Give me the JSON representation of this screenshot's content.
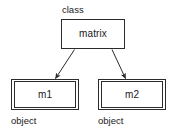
{
  "diagram": {
    "type": "uml-class-object-instantiation",
    "nodes": [
      {
        "id": "class-node",
        "name": "matrix",
        "stereotype": "class",
        "shape": "rectangle",
        "border_style": "single"
      },
      {
        "id": "object-node-m1",
        "name": "m1",
        "stereotype": "object",
        "shape": "rectangle",
        "border_style": "double"
      },
      {
        "id": "object-node-m2",
        "name": "m2",
        "stereotype": "object",
        "shape": "rectangle",
        "border_style": "double"
      }
    ],
    "edges": [
      {
        "id": "edge-matrix-m1",
        "from": "matrix",
        "to": "m1",
        "arrow": "open-arrowhead"
      },
      {
        "id": "edge-matrix-m2",
        "from": "matrix",
        "to": "m2",
        "arrow": "open-arrowhead"
      }
    ],
    "colors": {
      "background": "#ffffff",
      "stroke": "#2b2b2b",
      "text": "#1a1a1a"
    }
  }
}
